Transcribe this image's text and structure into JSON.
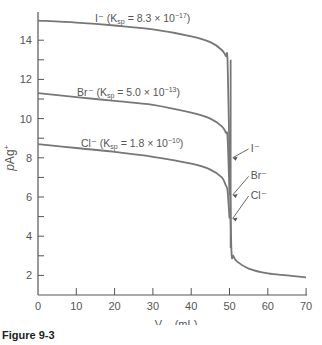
{
  "chart_data": {
    "type": "line",
    "title": "",
    "xlabel": "V_Ag+(mL)",
    "xlabel_main": "V",
    "xlabel_sub": "Ag+",
    "xlabel_unit": "(mL)",
    "ylabel": "pAg+",
    "xlim": [
      0,
      70
    ],
    "ylim": [
      1,
      15.4
    ],
    "x_ticks": [
      0,
      10,
      20,
      30,
      40,
      50,
      60,
      70
    ],
    "y_ticks": [
      2,
      4,
      6,
      8,
      10,
      12,
      14
    ],
    "y_minor_ticks": [
      3,
      5,
      7,
      9,
      11,
      13
    ],
    "grid": false,
    "series": [
      {
        "name": "I−",
        "label": "I⁻ (Ksp = 8.3 × 10⁻¹⁷)",
        "label_ion": "I⁻ (K",
        "label_sub": "sp",
        "label_rest": " = 8.3 × 10",
        "label_exp": "−17",
        "label_end": ")",
        "ksp": 8.3e-17,
        "end_annotation": "I⁻",
        "x": [
          0,
          10,
          20,
          30,
          40,
          45,
          48,
          49,
          49.5,
          50,
          50.5,
          51,
          52,
          55,
          60,
          65,
          70
        ],
        "y": [
          15.0,
          14.9,
          14.75,
          14.55,
          14.2,
          13.9,
          13.5,
          13.2,
          12.9,
          8.0,
          3.3,
          3.0,
          2.7,
          2.35,
          2.1,
          2.0,
          1.9
        ]
      },
      {
        "name": "Br−",
        "label": "Br⁻ (Ksp = 5.0 × 10⁻¹³)",
        "label_ion": "Br⁻ (K",
        "label_sub": "sp",
        "label_rest": " = 5.0 × 10",
        "label_exp": "−13",
        "label_end": ")",
        "ksp": 5e-13,
        "end_annotation": "Br⁻",
        "x": [
          0,
          10,
          20,
          30,
          40,
          45,
          48,
          49,
          49.5,
          50
        ],
        "y": [
          11.3,
          11.1,
          10.9,
          10.7,
          10.3,
          10.0,
          9.6,
          9.3,
          9.0,
          6.1
        ]
      },
      {
        "name": "Cl−",
        "label": "Cl⁻ (Ksp = 1.8 × 10⁻¹⁰)",
        "label_ion": "Cl⁻ (K",
        "label_sub": "sp",
        "label_rest": " = 1.8 × 10",
        "label_exp": "−10",
        "label_end": ")",
        "ksp": 1.8e-10,
        "end_annotation": "Cl⁻",
        "x": [
          0,
          10,
          20,
          30,
          40,
          45,
          48,
          49,
          49.5,
          50
        ],
        "y": [
          8.7,
          8.5,
          8.3,
          8.05,
          7.7,
          7.4,
          7.0,
          6.6,
          6.3,
          4.9
        ]
      }
    ],
    "line_color": "#777777"
  },
  "figure_caption": "Figure 9-3"
}
